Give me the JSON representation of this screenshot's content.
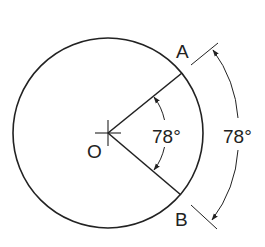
{
  "diagram": {
    "type": "circle-central-angle",
    "circle": {
      "center_label": "O",
      "cx": 108,
      "cy": 133,
      "r": 95
    },
    "points": [
      {
        "label": "A",
        "x": 182,
        "y": 73
      },
      {
        "label": "B",
        "x": 181,
        "y": 195
      }
    ],
    "central_angle": {
      "label": "78°",
      "value_deg": 78
    },
    "arc_dimension": {
      "label": "78°",
      "value_deg": 78
    },
    "colors": {
      "stroke": "#222222",
      "background": "#ffffff"
    }
  }
}
